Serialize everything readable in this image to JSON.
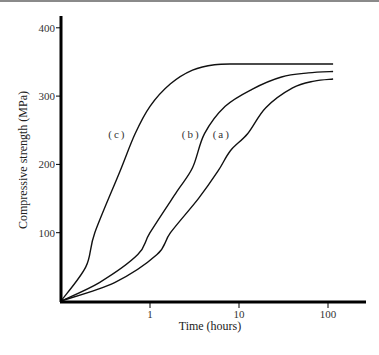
{
  "chart_data": {
    "type": "line",
    "title": "",
    "xlabel": "Time (hours)",
    "ylabel": "Compressive strength (MPa)",
    "xscale": "log",
    "xlim": [
      0.1,
      250
    ],
    "ylim": [
      0,
      420
    ],
    "x_ticks": [
      1,
      10,
      100
    ],
    "x_tick_labels": [
      "1",
      "10",
      "100"
    ],
    "y_ticks": [
      100,
      200,
      300,
      400
    ],
    "y_tick_labels": [
      "100",
      "200",
      "300",
      "400"
    ],
    "grid": false,
    "legend": "inline curve labels",
    "series": [
      {
        "name": "(c)",
        "label_pos": [
          0.43,
          245
        ],
        "x": [
          0.1,
          0.19,
          0.24,
          0.46,
          0.68,
          1.0,
          1.7,
          3.0,
          5.3,
          10,
          30,
          114
        ],
        "y": [
          0,
          50,
          100,
          190,
          245,
          285,
          318,
          338,
          346,
          347,
          347,
          347
        ]
      },
      {
        "name": "(b)",
        "label_pos": [
          2.9,
          245
        ],
        "x": [
          0.1,
          0.27,
          0.73,
          1.0,
          2.0,
          3.0,
          4.1,
          7.0,
          14,
          30,
          60,
          114
        ],
        "y": [
          0,
          27,
          68,
          100,
          160,
          195,
          245,
          285,
          310,
          328,
          334,
          336
        ]
      },
      {
        "name": "(a)",
        "label_pos": [
          6.4,
          245
        ],
        "x": [
          0.1,
          0.4,
          1.2,
          1.7,
          3.5,
          5.8,
          8.0,
          12.5,
          20,
          40,
          70,
          114
        ],
        "y": [
          0,
          27,
          68,
          100,
          150,
          190,
          220,
          245,
          283,
          312,
          322,
          325
        ]
      }
    ]
  },
  "figure": {
    "xlabel": "Time (hours)",
    "ylabel": "Compressive strength (MPa)",
    "x_ticks": [
      "1",
      "10",
      "100"
    ],
    "y_ticks": [
      "100",
      "200",
      "300",
      "400"
    ],
    "curve_labels": [
      "(c)",
      "(b)",
      "(a)"
    ],
    "line_color": "#111111"
  }
}
